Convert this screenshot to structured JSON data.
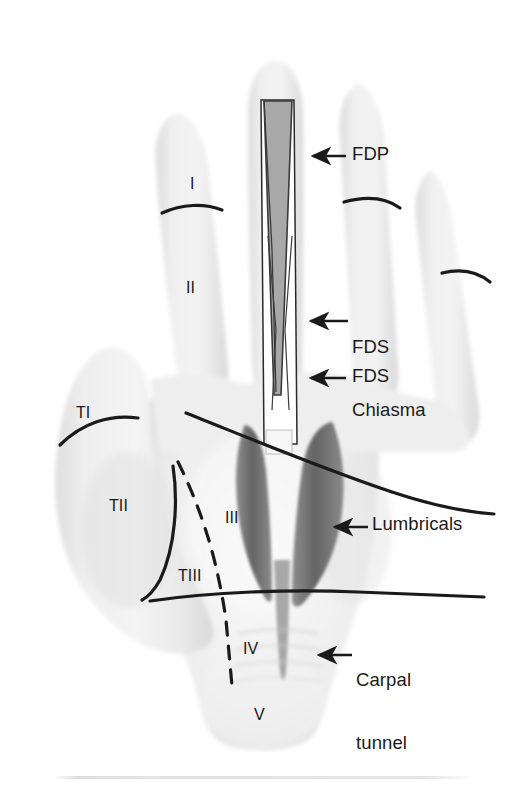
{
  "figure": {
    "background_color": "#ffffff",
    "skin_color": "#ebebeb",
    "skin_shadow_color": "#dcdcdc",
    "line_color": "#1a1a1a",
    "fdp_fill_color": "#a8a8a8",
    "lumbrical_fill_color": "#6e6e6e",
    "fds_fill_color": "#ffffff"
  },
  "callouts": [
    {
      "id": "fdp",
      "label": "FDP",
      "meaning": "flexor digitorum profundus tendon",
      "text_x": 352,
      "text_y": 144,
      "arrow_tip_x": 312,
      "arrow_tip_y": 156,
      "arrow_tail_x": 346,
      "arrow_tail_y": 156
    },
    {
      "id": "fds-chiasma",
      "label": "FDS\nChiasma",
      "line1": "FDS",
      "line2": "Chiasma",
      "meaning": "Camper chiasma of flexor digitorum superficialis",
      "text_x": 352,
      "text_y": 296,
      "arrow_tip_x": 310,
      "arrow_tip_y": 321,
      "arrow_tail_x": 348,
      "arrow_tail_y": 321
    },
    {
      "id": "fds",
      "label": "FDS",
      "meaning": "flexor digitorum superficialis tendon",
      "text_x": 352,
      "text_y": 366,
      "arrow_tip_x": 310,
      "arrow_tip_y": 378,
      "arrow_tail_x": 346,
      "arrow_tail_y": 378
    },
    {
      "id": "lumbricals",
      "label": "Lumbricals",
      "meaning": "lumbrical muscles of the palm",
      "text_x": 372,
      "text_y": 514,
      "arrow_tip_x": 334,
      "arrow_tip_y": 527,
      "arrow_tail_x": 368,
      "arrow_tail_y": 527
    },
    {
      "id": "carpal-tunnel",
      "label": "Carpal\ntunnel",
      "line1": "Carpal",
      "line2": "tunnel",
      "meaning": "carpal tunnel at the wrist",
      "text_x": 356,
      "text_y": 629,
      "arrow_tip_x": 318,
      "arrow_tip_y": 655,
      "arrow_tail_x": 352,
      "arrow_tail_y": 655
    }
  ],
  "zone_labels": [
    {
      "id": "zone-1",
      "label": "I",
      "x": 190,
      "y": 175,
      "meaning": "flexor zone I, distal to FDS insertion"
    },
    {
      "id": "zone-2",
      "label": "II",
      "x": 186,
      "y": 279,
      "meaning": "flexor zone II, no man's land"
    },
    {
      "id": "zone-3",
      "label": "III",
      "x": 225,
      "y": 509,
      "meaning": "flexor zone III, palm"
    },
    {
      "id": "zone-4",
      "label": "IV",
      "x": 243,
      "y": 640,
      "meaning": "flexor zone IV, carpal tunnel"
    },
    {
      "id": "zone-5",
      "label": "V",
      "x": 254,
      "y": 706,
      "meaning": "flexor zone V, forearm proximal to carpal tunnel"
    },
    {
      "id": "zone-t1",
      "label": "TI",
      "x": 76,
      "y": 404,
      "meaning": "thumb flexor zone TI"
    },
    {
      "id": "zone-t2",
      "label": "TII",
      "x": 109,
      "y": 497,
      "meaning": "thumb flexor zone TII"
    },
    {
      "id": "zone-t3",
      "label": "TIII",
      "x": 178,
      "y": 567,
      "meaning": "thumb flexor zone TIII"
    }
  ]
}
